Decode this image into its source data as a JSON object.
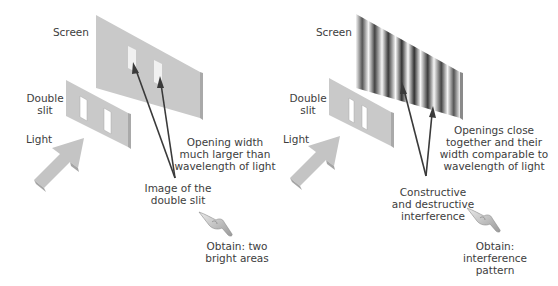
{
  "left_panel": {
    "screen_label": "Screen",
    "slit_label": [
      "Double",
      "slit"
    ],
    "light_label": "Light",
    "condition_text": [
      "Opening width",
      "much larger than",
      "wavelength of light"
    ],
    "result_text": [
      "Image of the",
      "double slit"
    ],
    "obtain_text": [
      "Obtain: two",
      "bright areas"
    ],
    "screen_pattern": "two-bright-rectangles"
  },
  "right_panel": {
    "screen_label": "Screen",
    "slit_label": [
      "Double",
      "slit"
    ],
    "light_label": "Light",
    "condition_text": [
      "Openings close",
      "together and their",
      "width comparable to",
      "wavelength of light"
    ],
    "result_text": [
      "Constructive",
      "and destructive",
      "interference"
    ],
    "obtain_text": [
      "Obtain:",
      "interference",
      "pattern"
    ],
    "screen_pattern": "interference-fringes"
  },
  "colors": {
    "panel_gray": "#c9c9c9",
    "panel_edge": "#a9a9a9",
    "arrow_line": "#3a3a3a",
    "text": "#3d3d3d"
  }
}
